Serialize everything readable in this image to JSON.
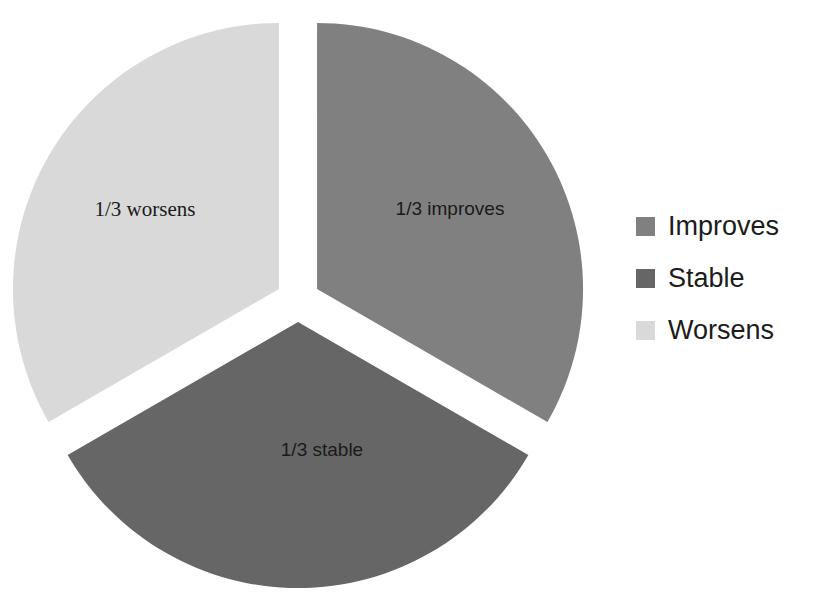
{
  "chart_data": {
    "type": "pie",
    "title": "",
    "subtitle": "",
    "xlabel": "",
    "ylabel": "",
    "exploded": true,
    "grid": false,
    "legend_position": "right",
    "start_angle_deg": 0,
    "categories": [
      "Improves",
      "Stable",
      "Worsens"
    ],
    "values": [
      33.3333,
      33.3333,
      33.3333
    ],
    "value_fractions": [
      "1/3",
      "1/3",
      "1/3"
    ],
    "colors": [
      "#808080",
      "#666666",
      "#d9d9d9"
    ],
    "slices": [
      {
        "name": "Improves",
        "label": "1/3 improves",
        "fraction": "1/3",
        "value": 33.3333,
        "color": "#808080",
        "label_font": "sans-serif",
        "label_x": 450,
        "label_y": 210
      },
      {
        "name": "Stable",
        "label": "1/3 stable",
        "fraction": "1/3",
        "value": 33.3333,
        "color": "#666666",
        "label_font": "sans-serif",
        "label_x": 322,
        "label_y": 451
      },
      {
        "name": "Worsens",
        "label": "1/3 worsens",
        "fraction": "1/3",
        "value": 33.3333,
        "color": "#d9d9d9",
        "label_font": "serif",
        "label_x": 145,
        "label_y": 211
      }
    ],
    "annotations": [
      "1/3 improves",
      "1/3 stable",
      "1/3 worsens"
    ]
  },
  "legend": {
    "items": [
      {
        "label": "Improves",
        "color": "#808080",
        "swatch_name": "legend-swatch-improves"
      },
      {
        "label": "Stable",
        "color": "#666666",
        "swatch_name": "legend-swatch-stable"
      },
      {
        "label": "Worsens",
        "color": "#d9d9d9",
        "swatch_name": "legend-swatch-worsens"
      }
    ]
  },
  "geometry": {
    "center_x": 298,
    "center_y": 300,
    "radius": 266,
    "explode_offset": 22,
    "note": "three equal 120-degree sectors, each displaced outward from the pie center"
  }
}
